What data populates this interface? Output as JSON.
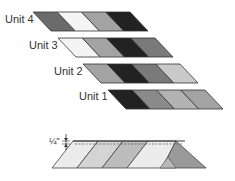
{
  "units": [
    {
      "label": "Unit 4",
      "label_x": 5,
      "label_y": 19,
      "strip": {
        "x": 33,
        "y": 12,
        "w": 97,
        "h": 19,
        "skew": 18
      },
      "colors": [
        "#6b6b6b",
        "#f4f4f4",
        "#a3a3a3",
        "#222222"
      ]
    },
    {
      "label": "Unit 3",
      "label_x": 29,
      "label_y": 45,
      "strip": {
        "x": 58,
        "y": 38,
        "w": 97,
        "h": 19,
        "skew": 18
      },
      "colors": [
        "#f4f4f4",
        "#a3a3a3",
        "#222222",
        "#7a7a7a"
      ]
    },
    {
      "label": "Unit 2",
      "label_x": 54,
      "label_y": 71,
      "strip": {
        "x": 83,
        "y": 64,
        "w": 97,
        "h": 19,
        "skew": 18
      },
      "colors": [
        "#a3a3a3",
        "#222222",
        "#7a7a7a",
        "#c9c9c9"
      ]
    },
    {
      "label": "Unit 1",
      "label_x": 79,
      "label_y": 96,
      "strip": {
        "x": 108,
        "y": 90,
        "w": 97,
        "h": 19,
        "skew": 18
      },
      "colors": [
        "#222222",
        "#8a8a8a",
        "#b3b3b3",
        "#a3a3a3"
      ]
    }
  ],
  "seam_diagram": {
    "allowance_label": "¼\"",
    "colors": [
      "#ebebeb",
      "#d0d0d0",
      "#b8b8b8",
      "#ececec",
      "#9a9a9a"
    ]
  }
}
